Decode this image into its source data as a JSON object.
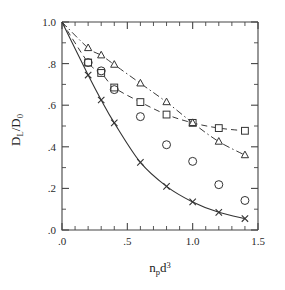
{
  "chart_data": {
    "type": "scatter",
    "title": "",
    "xlabel": "n_p d^3",
    "xlabel_parts": {
      "base1": "n",
      "sub1": "p",
      "base2": "d",
      "sup2": "3"
    },
    "ylabel": "D_L/D_0",
    "ylabel_parts": {
      "base1": "D",
      "sub1": "L",
      "slash": "/",
      "base2": "D",
      "sub2": "0"
    },
    "xlim": [
      0.0,
      1.5
    ],
    "ylim": [
      0.0,
      1.0
    ],
    "xticks": [
      0.0,
      0.5,
      1.0,
      1.5
    ],
    "xticklabels": [
      ".0",
      ".5",
      "1.0",
      "1.5"
    ],
    "yticks": [
      0.0,
      0.2,
      0.4,
      0.6,
      0.8,
      1.0
    ],
    "yticklabels": [
      ".0",
      ".2",
      ".4",
      ".6",
      ".8",
      "1.0"
    ],
    "x_minor_ticks": [
      0.1,
      0.2,
      0.3,
      0.4,
      0.6,
      0.7,
      0.8,
      0.9,
      1.1,
      1.2,
      1.3,
      1.4
    ],
    "y_minor_ticks": [
      0.1,
      0.3,
      0.5,
      0.7,
      0.9
    ],
    "grid": false,
    "legend": "none",
    "series": [
      {
        "name": "solid-line-cross",
        "marker": "cross",
        "line": "solid",
        "x": [
          0.0,
          0.2,
          0.3,
          0.4,
          0.6,
          0.8,
          1.0,
          1.2,
          1.4
        ],
        "y": [
          1.0,
          0.745,
          0.625,
          0.515,
          0.325,
          0.21,
          0.135,
          0.085,
          0.055
        ]
      },
      {
        "name": "dashed-line-square",
        "marker": "square",
        "line": "dashed",
        "x": [
          0.0,
          0.2,
          0.3,
          0.4,
          0.6,
          0.8,
          1.0,
          1.2,
          1.4
        ],
        "y": [
          1.0,
          0.805,
          0.755,
          0.685,
          0.615,
          0.555,
          0.515,
          0.49,
          0.477
        ]
      },
      {
        "name": "dashdot-line-triangle",
        "marker": "triangle",
        "line": "dashdot",
        "x": [
          0.0,
          0.2,
          0.3,
          0.4,
          0.6,
          0.8,
          1.0,
          1.2,
          1.4
        ],
        "y": [
          1.0,
          0.875,
          0.84,
          0.795,
          0.705,
          0.615,
          0.515,
          0.425,
          0.36
        ]
      },
      {
        "name": "open-circles",
        "marker": "circle",
        "line": "none",
        "x": [
          0.2,
          0.3,
          0.4,
          0.6,
          0.8,
          1.0,
          1.2,
          1.4
        ],
        "y": [
          0.805,
          0.765,
          0.675,
          0.545,
          0.41,
          0.33,
          0.218,
          0.142
        ]
      }
    ]
  },
  "figure": {
    "background_color": "#ffffff",
    "axis_color": "#444444",
    "ink_color": "#333333"
  }
}
